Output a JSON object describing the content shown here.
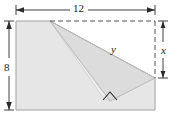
{
  "figure": {
    "colors": {
      "paper_fill": "#e8e8e8",
      "fold_fill": "#dedede",
      "under_fill": "#f0f0f0",
      "outline": "#b4b4b4",
      "dashed": "#404040",
      "label": "#1a1a1a",
      "background": "#ffffff"
    },
    "labels": {
      "width": "12",
      "height": "8",
      "hypotenuse": "y",
      "right_segment": "x"
    },
    "dimensions": {
      "rectangle_width": 12,
      "rectangle_height": 8
    },
    "markers": {
      "right_angle": "right-angle-mark",
      "width_arrow": "double-headed-arrow-horizontal",
      "height_arrow": "double-headed-arrow-vertical",
      "x_arrow": "double-headed-arrow-vertical"
    }
  }
}
